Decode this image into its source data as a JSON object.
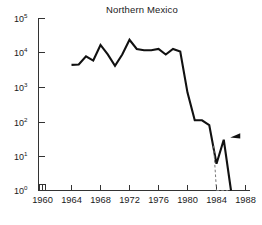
{
  "chart_data": {
    "type": "line",
    "title": "Northern Mexico",
    "xlabel": "",
    "ylabel": "",
    "yscale": "log",
    "ylim": [
      1,
      100000
    ],
    "xlim": [
      1960,
      1988
    ],
    "grid": false,
    "legend_position": "none",
    "y_tick_labels": [
      "10^0",
      "10^1",
      "10^2",
      "10^3",
      "10^4",
      "10^5"
    ],
    "y_tick_values": [
      1,
      10,
      100,
      1000,
      10000,
      100000
    ],
    "x_tick_labels": [
      "1960",
      "1964",
      "1968",
      "1972",
      "1976",
      "1980",
      "1984",
      "1988"
    ],
    "x_tick_values": [
      1960,
      1964,
      1968,
      1972,
      1976,
      1980,
      1984,
      1988
    ],
    "axis_break": "x-axis break just right of origin between 1960 and 1964",
    "series": [
      {
        "name": "Northern Mexico",
        "x": [
          1964,
          1965,
          1966,
          1967,
          1968,
          1969,
          1970,
          1971,
          1972,
          1973,
          1974,
          1975,
          1976,
          1977,
          1978,
          1979,
          1980,
          1981,
          1982,
          1983,
          1984,
          1985,
          1986
        ],
        "values": [
          4500,
          4600,
          8000,
          6000,
          17000,
          9000,
          4200,
          9000,
          24000,
          13000,
          12000,
          12000,
          13000,
          9000,
          13000,
          11000,
          700,
          110,
          110,
          80,
          6,
          30,
          0.8
        ],
        "linestyle": "solid"
      },
      {
        "name": "Northern Mexico (inferred)",
        "x": [
          1983.6,
          1984,
          1984,
          1985.6
        ],
        "values": [
          20,
          1,
          1,
          1
        ],
        "linestyle": "dashed",
        "note": "dashed drop to baseline at 1984 and baseline connector"
      }
    ],
    "annotations": [
      {
        "type": "arrow-marker",
        "shape": "left-pointing-solid-triangle",
        "x": 1985.9,
        "y": 35,
        "label": ""
      }
    ],
    "colors": {
      "line": "#111111",
      "dashed_line": "#777777",
      "axis": "#333333",
      "text": "#1a1a1a",
      "background": "#ffffff"
    }
  },
  "caption": {
    "ghost_text": "partially cropped caption"
  }
}
